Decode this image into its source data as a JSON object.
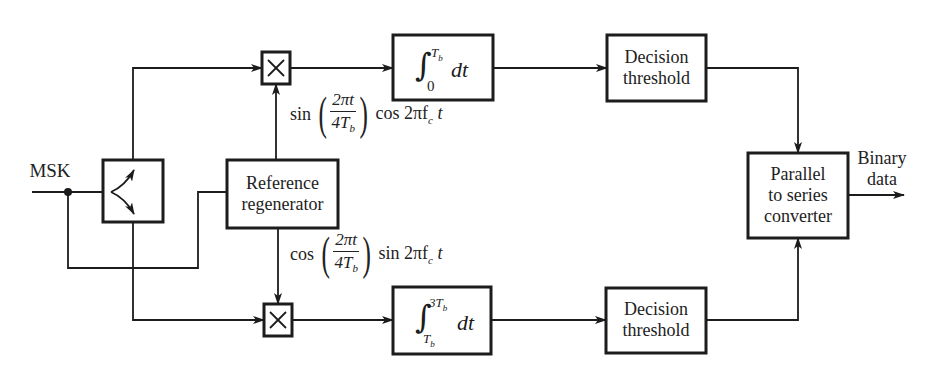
{
  "diagram": {
    "input_label": "MSK",
    "output_label": "Binary\ndata",
    "output_label_lines": [
      "Binary",
      "data"
    ],
    "blocks": {
      "splitter": {
        "label": "",
        "icon": "splitter-arrows-icon"
      },
      "multiplier_top": {
        "label": "×"
      },
      "multiplier_bottom": {
        "label": "×"
      },
      "reference_regenerator": {
        "lines": [
          "Reference",
          "regenerator"
        ]
      },
      "integrator_top": {
        "lower_limit": "0",
        "upper_limit": "T",
        "upper_limit_sub": "b",
        "integrand": "dt"
      },
      "integrator_bottom": {
        "lower_limit": "T",
        "lower_limit_sub": "b",
        "upper_limit": "3T",
        "upper_limit_sub": "b",
        "integrand": "dt"
      },
      "decision_top": {
        "lines": [
          "Decision",
          "threshold"
        ]
      },
      "decision_bottom": {
        "lines": [
          "Decision",
          "threshold"
        ]
      },
      "converter": {
        "lines": [
          "Parallel",
          "to series",
          "converter"
        ]
      }
    },
    "signals": {
      "top_reference": {
        "func1": "sin",
        "num": "2πt",
        "den": "4T",
        "den_sub": "b",
        "func2": "cos 2πf",
        "func2_sub": "c",
        "tail": " t"
      },
      "bottom_reference": {
        "func1": "cos",
        "num": "2πt",
        "den": "4T",
        "den_sub": "b",
        "func2": "sin 2πf",
        "func2_sub": "c",
        "tail": " t"
      }
    },
    "colors": {
      "ink": "#1c1c1c",
      "background": "#ffffff"
    }
  }
}
